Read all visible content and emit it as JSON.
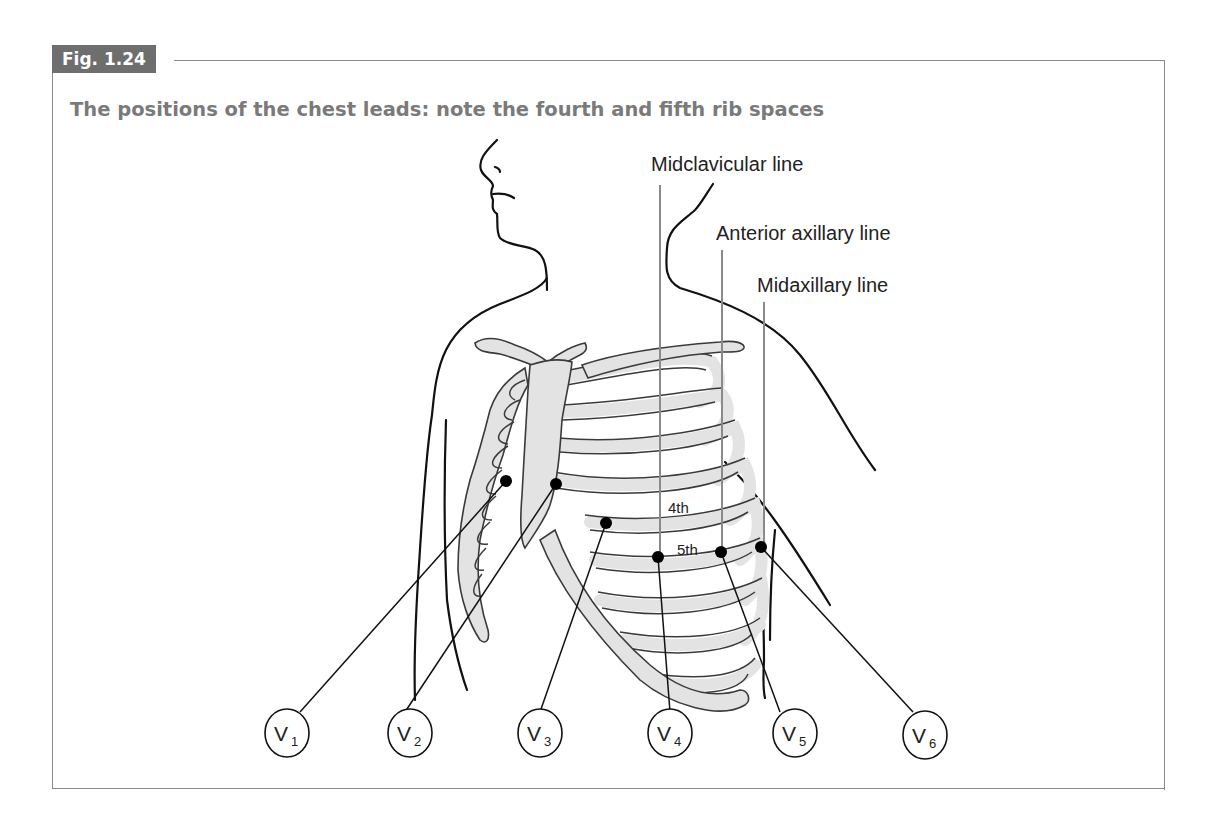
{
  "figure": {
    "number": "Fig. 1.24",
    "title": "The positions of the chest leads: note the fourth and fifth rib spaces"
  },
  "reference_lines": [
    {
      "label": "Midclavicular line"
    },
    {
      "label": "Anterior axillary line"
    },
    {
      "label": "Midaxillary line"
    }
  ],
  "rib_space_labels": [
    "4th",
    "5th"
  ],
  "leads": [
    {
      "main": "V",
      "sub": "1"
    },
    {
      "main": "V",
      "sub": "2"
    },
    {
      "main": "V",
      "sub": "3"
    },
    {
      "main": "V",
      "sub": "4"
    },
    {
      "main": "V",
      "sub": "5"
    },
    {
      "main": "V",
      "sub": "6"
    }
  ],
  "colors": {
    "tab_bg": "#6e6e6e",
    "title_text": "#7a7a7a",
    "bone_fill": "#e3e3e3",
    "frame": "#8a8a8a"
  }
}
